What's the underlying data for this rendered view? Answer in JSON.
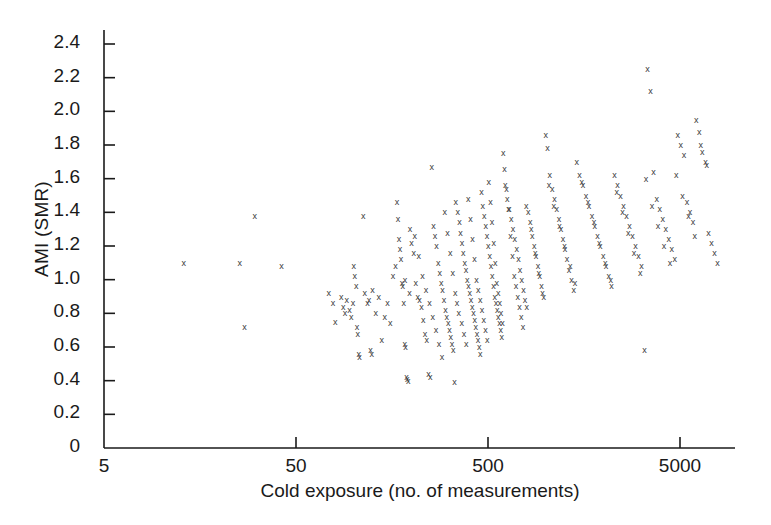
{
  "chart_data": {
    "type": "scatter",
    "title": "",
    "xlabel": "Cold exposure (no. of measurements)",
    "ylabel": "AMI (SMR)",
    "xscale": "log",
    "yscale": "linear",
    "xlim": [
      5,
      9500
    ],
    "ylim": [
      0,
      2.55
    ],
    "grid": false,
    "legend": null,
    "marker": "x",
    "marker_color": "#3a3a3a",
    "xticks": [
      5,
      50,
      500,
      5000
    ],
    "xtick_labels": [
      "5",
      "50",
      "500",
      "5000"
    ],
    "yticks": [
      0,
      0.2,
      0.4,
      0.6,
      0.8,
      1.0,
      1.2,
      1.4,
      1.6,
      1.8,
      2.0,
      2.2,
      2.4
    ],
    "ytick_labels": [
      "0",
      "0.2",
      "0.4",
      "0.6",
      "0.8",
      "1.0",
      "1.2",
      "1.4",
      "1.6",
      "1.8",
      "2.0",
      "2.2",
      "2.4"
    ],
    "points": [
      [
        13.0,
        1.1
      ],
      [
        27.0,
        0.72
      ],
      [
        30.5,
        1.38
      ],
      [
        25.5,
        1.1
      ],
      [
        42.0,
        1.08
      ],
      [
        74.0,
        0.92
      ],
      [
        78.0,
        0.86
      ],
      [
        80.0,
        0.75
      ],
      [
        86.0,
        0.9
      ],
      [
        88.0,
        0.84
      ],
      [
        90.0,
        0.8
      ],
      [
        92.0,
        0.88
      ],
      [
        95.0,
        0.82
      ],
      [
        97.0,
        0.78
      ],
      [
        99.0,
        0.86
      ],
      [
        100.0,
        1.08
      ],
      [
        101.0,
        1.02
      ],
      [
        103.0,
        0.96
      ],
      [
        104.0,
        0.72
      ],
      [
        105.0,
        0.68
      ],
      [
        106.0,
        0.56
      ],
      [
        107.0,
        0.54
      ],
      [
        112.0,
        1.38
      ],
      [
        114.0,
        0.92
      ],
      [
        118.0,
        0.86
      ],
      [
        120.0,
        0.88
      ],
      [
        122.0,
        0.58
      ],
      [
        124.0,
        0.56
      ],
      [
        130.0,
        0.8
      ],
      [
        140.0,
        0.64
      ],
      [
        150.0,
        0.86
      ],
      [
        160.0,
        1.02
      ],
      [
        168.0,
        1.46
      ],
      [
        170.0,
        1.36
      ],
      [
        172.0,
        1.24
      ],
      [
        174.0,
        1.18
      ],
      [
        176.0,
        1.12
      ],
      [
        178.0,
        0.98
      ],
      [
        180.0,
        0.96
      ],
      [
        182.0,
        0.86
      ],
      [
        184.0,
        0.62
      ],
      [
        186.0,
        0.6
      ],
      [
        188.0,
        0.42
      ],
      [
        190.0,
        0.41
      ],
      [
        192.0,
        0.4
      ],
      [
        196.0,
        1.3
      ],
      [
        200.0,
        1.22
      ],
      [
        205.0,
        1.16
      ],
      [
        210.0,
        0.98
      ],
      [
        215.0,
        0.9
      ],
      [
        220.0,
        0.88
      ],
      [
        225.0,
        0.84
      ],
      [
        230.0,
        0.76
      ],
      [
        235.0,
        0.68
      ],
      [
        240.0,
        0.64
      ],
      [
        245.0,
        0.44
      ],
      [
        250.0,
        0.42
      ],
      [
        255.0,
        1.67
      ],
      [
        260.0,
        1.32
      ],
      [
        265.0,
        1.26
      ],
      [
        270.0,
        1.2
      ],
      [
        275.0,
        1.1
      ],
      [
        280.0,
        1.04
      ],
      [
        285.0,
        0.98
      ],
      [
        290.0,
        0.94
      ],
      [
        295.0,
        0.88
      ],
      [
        300.0,
        0.82
      ],
      [
        305.0,
        0.78
      ],
      [
        310.0,
        0.74
      ],
      [
        315.0,
        0.7
      ],
      [
        320.0,
        0.66
      ],
      [
        325.0,
        0.62
      ],
      [
        330.0,
        0.58
      ],
      [
        335.0,
        0.39
      ],
      [
        340.0,
        1.46
      ],
      [
        348.0,
        1.4
      ],
      [
        355.0,
        1.34
      ],
      [
        360.0,
        1.28
      ],
      [
        366.0,
        1.22
      ],
      [
        372.0,
        1.16
      ],
      [
        378.0,
        1.1
      ],
      [
        384.0,
        1.06
      ],
      [
        390.0,
        1.0
      ],
      [
        396.0,
        0.96
      ],
      [
        402.0,
        0.92
      ],
      [
        408.0,
        0.88
      ],
      [
        414.0,
        0.84
      ],
      [
        420.0,
        0.8
      ],
      [
        426.0,
        0.76
      ],
      [
        432.0,
        0.72
      ],
      [
        438.0,
        0.68
      ],
      [
        444.0,
        0.64
      ],
      [
        450.0,
        0.6
      ],
      [
        456.0,
        0.56
      ],
      [
        462.0,
        1.52
      ],
      [
        470.0,
        1.44
      ],
      [
        478.0,
        1.38
      ],
      [
        486.0,
        1.32
      ],
      [
        494.0,
        1.26
      ],
      [
        502.0,
        1.2
      ],
      [
        510.0,
        1.14
      ],
      [
        518.0,
        1.08
      ],
      [
        526.0,
        1.02
      ],
      [
        534.0,
        0.96
      ],
      [
        542.0,
        0.9
      ],
      [
        550.0,
        0.86
      ],
      [
        558.0,
        0.82
      ],
      [
        566.0,
        0.78
      ],
      [
        574.0,
        0.74
      ],
      [
        582.0,
        0.7
      ],
      [
        590.0,
        0.66
      ],
      [
        600.0,
        1.75
      ],
      [
        615.0,
        1.56
      ],
      [
        630.0,
        1.48
      ],
      [
        645.0,
        1.42
      ],
      [
        660.0,
        1.36
      ],
      [
        675.0,
        1.3
      ],
      [
        690.0,
        1.24
      ],
      [
        705.0,
        1.18
      ],
      [
        720.0,
        1.12
      ],
      [
        735.0,
        1.06
      ],
      [
        750.0,
        1.0
      ],
      [
        765.0,
        0.94
      ],
      [
        780.0,
        0.88
      ],
      [
        795.0,
        0.84
      ],
      [
        810.0,
        1.4
      ],
      [
        830.0,
        1.34
      ],
      [
        850.0,
        1.26
      ],
      [
        870.0,
        1.2
      ],
      [
        890.0,
        1.14
      ],
      [
        910.0,
        1.08
      ],
      [
        930.0,
        1.02
      ],
      [
        950.0,
        0.96
      ],
      [
        975.0,
        0.9
      ],
      [
        1000.0,
        1.86
      ],
      [
        1020.0,
        1.78
      ],
      [
        1050.0,
        1.62
      ],
      [
        1080.0,
        1.54
      ],
      [
        1110.0,
        1.48
      ],
      [
        1140.0,
        1.42
      ],
      [
        1170.0,
        1.36
      ],
      [
        1200.0,
        1.3
      ],
      [
        1230.0,
        1.24
      ],
      [
        1260.0,
        1.18
      ],
      [
        1290.0,
        1.12
      ],
      [
        1320.0,
        1.06
      ],
      [
        1360.0,
        1.0
      ],
      [
        1400.0,
        0.94
      ],
      [
        1450.0,
        1.7
      ],
      [
        1500.0,
        1.62
      ],
      [
        1560.0,
        1.56
      ],
      [
        1620.0,
        1.5
      ],
      [
        1680.0,
        1.44
      ],
      [
        1740.0,
        1.38
      ],
      [
        1800.0,
        1.32
      ],
      [
        1860.0,
        1.26
      ],
      [
        1920.0,
        1.2
      ],
      [
        1990.0,
        1.14
      ],
      [
        2060.0,
        1.08
      ],
      [
        2130.0,
        1.02
      ],
      [
        2200.0,
        0.96
      ],
      [
        2280.0,
        1.62
      ],
      [
        2360.0,
        1.56
      ],
      [
        2450.0,
        1.5
      ],
      [
        2540.0,
        1.44
      ],
      [
        2630.0,
        1.38
      ],
      [
        2730.0,
        1.32
      ],
      [
        2830.0,
        1.26
      ],
      [
        2930.0,
        1.2
      ],
      [
        3040.0,
        1.14
      ],
      [
        3150.0,
        1.08
      ],
      [
        3270.0,
        0.58
      ],
      [
        3390.0,
        2.25
      ],
      [
        3510.0,
        2.12
      ],
      [
        3640.0,
        1.64
      ],
      [
        3780.0,
        1.48
      ],
      [
        3920.0,
        1.42
      ],
      [
        4060.0,
        1.36
      ],
      [
        4210.0,
        1.3
      ],
      [
        4370.0,
        1.24
      ],
      [
        4530.0,
        1.18
      ],
      [
        4700.0,
        1.12
      ],
      [
        4870.0,
        1.86
      ],
      [
        5050.0,
        1.8
      ],
      [
        5240.0,
        1.74
      ],
      [
        5440.0,
        1.46
      ],
      [
        5640.0,
        1.4
      ],
      [
        5850.0,
        1.34
      ],
      [
        6070.0,
        1.95
      ],
      [
        6300.0,
        1.88
      ],
      [
        6530.0,
        1.76
      ],
      [
        6780.0,
        1.7
      ],
      [
        7030.0,
        1.28
      ],
      [
        7290.0,
        1.22
      ],
      [
        7560.0,
        1.16
      ],
      [
        7840.0,
        1.1
      ],
      [
        125.0,
        0.94
      ],
      [
        135.0,
        0.9
      ],
      [
        145.0,
        0.78
      ],
      [
        155.0,
        0.74
      ],
      [
        165.0,
        1.08
      ],
      [
        185.0,
        1.0
      ],
      [
        195.0,
        0.92
      ],
      [
        208.0,
        1.26
      ],
      [
        218.0,
        1.14
      ],
      [
        228.0,
        1.02
      ],
      [
        238.0,
        0.94
      ],
      [
        248.0,
        0.86
      ],
      [
        258.0,
        0.78
      ],
      [
        268.0,
        0.7
      ],
      [
        278.0,
        0.62
      ],
      [
        288.0,
        0.54
      ],
      [
        298.0,
        1.4
      ],
      [
        308.0,
        1.28
      ],
      [
        318.0,
        1.16
      ],
      [
        328.0,
        1.04
      ],
      [
        338.0,
        0.92
      ],
      [
        345.0,
        0.86
      ],
      [
        352.0,
        0.8
      ],
      [
        365.0,
        0.74
      ],
      [
        375.0,
        0.68
      ],
      [
        385.0,
        0.62
      ],
      [
        395.0,
        1.48
      ],
      [
        405.0,
        1.36
      ],
      [
        415.0,
        1.24
      ],
      [
        425.0,
        1.12
      ],
      [
        435.0,
        1.0
      ],
      [
        445.0,
        0.94
      ],
      [
        455.0,
        0.88
      ],
      [
        465.0,
        0.82
      ],
      [
        475.0,
        0.76
      ],
      [
        485.0,
        0.7
      ],
      [
        495.0,
        0.64
      ],
      [
        505.0,
        1.58
      ],
      [
        515.0,
        1.46
      ],
      [
        525.0,
        1.34
      ],
      [
        535.0,
        1.22
      ],
      [
        545.0,
        1.1
      ],
      [
        555.0,
        0.98
      ],
      [
        565.0,
        0.92
      ],
      [
        575.0,
        0.86
      ],
      [
        585.0,
        0.8
      ],
      [
        595.0,
        0.74
      ],
      [
        610.0,
        1.66
      ],
      [
        625.0,
        1.54
      ],
      [
        640.0,
        1.42
      ],
      [
        655.0,
        1.26
      ],
      [
        670.0,
        1.14
      ],
      [
        685.0,
        1.02
      ],
      [
        700.0,
        0.96
      ],
      [
        715.0,
        0.9
      ],
      [
        730.0,
        0.84
      ],
      [
        745.0,
        0.78
      ],
      [
        760.0,
        0.72
      ],
      [
        790.0,
        1.44
      ],
      [
        840.0,
        1.3
      ],
      [
        880.0,
        1.16
      ],
      [
        920.0,
        1.04
      ],
      [
        960.0,
        0.92
      ],
      [
        1040.0,
        1.56
      ],
      [
        1100.0,
        1.44
      ],
      [
        1180.0,
        1.32
      ],
      [
        1250.0,
        1.2
      ],
      [
        1340.0,
        1.08
      ],
      [
        1420.0,
        0.98
      ],
      [
        1540.0,
        1.58
      ],
      [
        1660.0,
        1.46
      ],
      [
        1780.0,
        1.34
      ],
      [
        1900.0,
        1.22
      ],
      [
        2040.0,
        1.1
      ],
      [
        2180.0,
        1.0
      ],
      [
        2340.0,
        1.52
      ],
      [
        2510.0,
        1.4
      ],
      [
        2690.0,
        1.28
      ],
      [
        2880.0,
        1.16
      ],
      [
        3100.0,
        1.04
      ],
      [
        3330.0,
        1.6
      ],
      [
        3570.0,
        1.44
      ],
      [
        3840.0,
        1.32
      ],
      [
        4130.0,
        1.2
      ],
      [
        4440.0,
        1.1
      ],
      [
        4780.0,
        1.62
      ],
      [
        5150.0,
        1.5
      ],
      [
        5540.0,
        1.38
      ],
      [
        5960.0,
        1.26
      ],
      [
        6410.0,
        1.8
      ],
      [
        6900.0,
        1.68
      ]
    ]
  },
  "axes": {
    "spine_color": "#1a1a1a",
    "tick_color": "#1a1a1a"
  }
}
